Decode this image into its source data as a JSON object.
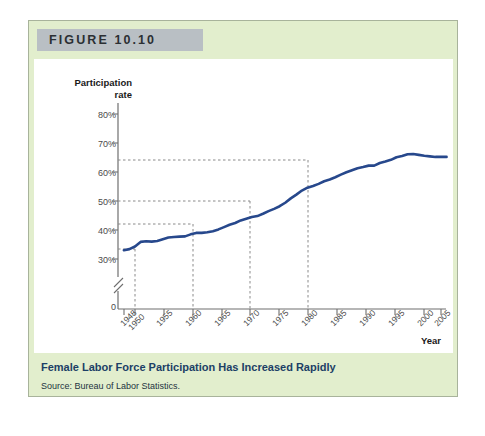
{
  "figure": {
    "banner_label": "FIGURE 10.10",
    "caption_title": "Female Labor Force Participation Has Increased Rapidly",
    "caption_source": "Source: Bureau of Labor Statistics.",
    "colors": {
      "card_background": "#e2eecd",
      "card_border": "#a8b39b",
      "banner_background": "#b9bfc4",
      "plot_background": "#ffffff",
      "series_line": "#27488c",
      "caption_title_color": "#1c3f66",
      "guide_line": "#8a8a8a",
      "axis": "#6f6f6f"
    }
  },
  "chart_data": {
    "type": "line",
    "title": "Female Labor Force Participation Has Increased Rapidly",
    "xlabel": "Year",
    "ylabel": "Participation rate",
    "ylabel_lines": [
      "Participation",
      "rate"
    ],
    "xlim": [
      1948,
      2006
    ],
    "ylim": [
      30,
      82
    ],
    "y_axis_break": true,
    "y_zero_label": "0",
    "grid": false,
    "legend": "none",
    "ytick_values": [
      80,
      70,
      60,
      50,
      40,
      30
    ],
    "ytick_labels": [
      "80%",
      "70%",
      "60%",
      "50%",
      "40%",
      "30%"
    ],
    "xtick_values": [
      1948,
      1950,
      1955,
      1960,
      1965,
      1970,
      1975,
      1980,
      1985,
      1990,
      1995,
      2000,
      2005
    ],
    "xtick_labels": [
      "1948",
      "1950",
      "1955",
      "1960",
      "1965",
      "1970",
      "1975",
      "1980",
      "1985",
      "1990",
      "1995",
      "2000",
      "2005"
    ],
    "series": [
      {
        "name": "Female labor force participation rate",
        "x": [
          1948,
          1949,
          1950,
          1951,
          1952,
          1953,
          1954,
          1955,
          1956,
          1957,
          1958,
          1959,
          1960,
          1961,
          1962,
          1963,
          1964,
          1965,
          1966,
          1967,
          1968,
          1969,
          1970,
          1971,
          1972,
          1973,
          1974,
          1975,
          1976,
          1977,
          1978,
          1979,
          1980,
          1981,
          1982,
          1983,
          1984,
          1985,
          1986,
          1987,
          1988,
          1989,
          1990,
          1991,
          1992,
          1993,
          1994,
          1995,
          1996,
          1997,
          1998,
          1999,
          2000,
          2001,
          2002,
          2003,
          2004,
          2005,
          2006
        ],
        "y": [
          33.0,
          33.4,
          34.3,
          35.9,
          36.1,
          36.0,
          36.2,
          36.8,
          37.4,
          37.6,
          37.7,
          37.8,
          38.5,
          39.0,
          39.0,
          39.2,
          39.6,
          40.2,
          41.0,
          41.8,
          42.4,
          43.3,
          43.9,
          44.5,
          44.8,
          45.6,
          46.5,
          47.3,
          48.2,
          49.4,
          50.9,
          52.2,
          53.6,
          54.6,
          55.2,
          55.9,
          56.8,
          57.4,
          58.2,
          59.1,
          59.9,
          60.6,
          61.3,
          61.7,
          62.2,
          62.2,
          63.1,
          63.6,
          64.2,
          65.1,
          65.5,
          66.1,
          66.2,
          65.9,
          65.6,
          65.4,
          65.2,
          65.2,
          65.2
        ],
        "y_plotted": [
          33.0,
          33.4,
          34.3,
          35.9,
          36.1,
          36.0,
          36.2,
          36.8,
          37.4,
          37.6,
          37.7,
          37.8,
          38.5,
          39.0,
          39.0,
          39.2,
          39.6,
          40.2,
          41.0,
          41.8,
          42.4,
          43.3,
          43.9,
          44.5,
          44.8,
          45.6,
          46.5,
          47.3,
          48.2,
          49.4,
          50.9,
          52.2,
          53.6,
          54.6,
          55.2,
          55.9,
          56.8,
          57.4,
          58.2,
          59.1,
          59.9,
          60.6,
          61.3,
          61.7,
          62.2,
          62.2,
          63.1,
          63.6,
          64.2,
          65.1,
          65.5,
          66.1,
          66.2,
          65.9,
          65.6,
          65.4,
          65.2,
          65.2,
          65.2
        ]
      }
    ],
    "annotations": [
      {
        "type": "guide",
        "year": 1950,
        "value": 34.3,
        "label": "1950 reference"
      },
      {
        "type": "guide",
        "year": 1960,
        "value": 43.0,
        "label": "1960 reference"
      },
      {
        "type": "guide",
        "year": 1970,
        "value": 50.0,
        "label": "1970 reference"
      },
      {
        "type": "guide",
        "year": 1980,
        "value": 64.0,
        "label": "1980 reference"
      }
    ]
  }
}
